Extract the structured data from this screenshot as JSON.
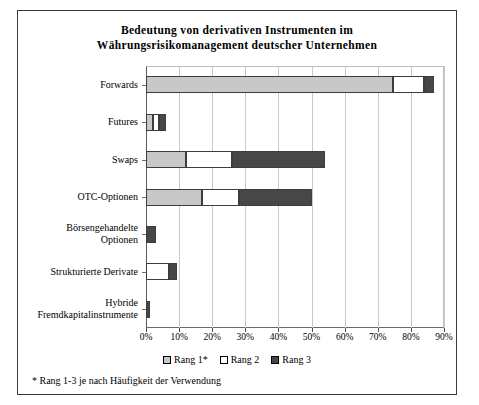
{
  "chart_data": {
    "type": "bar",
    "orientation": "horizontal",
    "stacked": true,
    "title": "Bedeutung von derivativen Instrumenten im Währungsrisikomanagement deutscher Unternehmen",
    "title_lines": [
      "Bedeutung von derivativen Instrumenten im",
      "Währungsrisikomanagement deutscher Unternehmen"
    ],
    "xlabel": "",
    "ylabel": "",
    "xlim": [
      0,
      90
    ],
    "xticks": [
      0,
      10,
      20,
      30,
      40,
      50,
      60,
      70,
      80,
      90
    ],
    "xticklabels": [
      "0%",
      "10%",
      "20%",
      "30%",
      "40%",
      "50%",
      "60%",
      "70%",
      "80%",
      "90%"
    ],
    "grid": true,
    "legend_position": "bottom",
    "categories": [
      "Forwards",
      "Futures",
      "Swaps",
      "OTC-Optionen",
      "Börsengehandelte Optionen",
      "Strukturierte Derivate",
      "Hybride Fremdkapitalinstrumente"
    ],
    "category_lines": [
      [
        "Forwards"
      ],
      [
        "Futures"
      ],
      [
        "Swaps"
      ],
      [
        "OTC-Optionen"
      ],
      [
        "Börsengehandelte",
        "Optionen"
      ],
      [
        "Strukturierte Derivate"
      ],
      [
        "Hybride",
        "Fremdkapitalinstrumente"
      ]
    ],
    "series": [
      {
        "name": "Rang 1*",
        "color": "#c8c8c8",
        "values": [
          74.5,
          2.0,
          12.0,
          17.0,
          0.0,
          0.0,
          0.0
        ]
      },
      {
        "name": "Rang 2",
        "color": "#ffffff",
        "values": [
          9.5,
          1.8,
          14.0,
          11.0,
          0.0,
          7.0,
          0.0
        ]
      },
      {
        "name": "Rang 3",
        "color": "#474747",
        "values": [
          3.0,
          2.2,
          28.0,
          22.0,
          3.0,
          2.5,
          1.2
        ]
      }
    ],
    "totals": [
      87.0,
      6.0,
      54.0,
      50.0,
      3.0,
      9.5,
      1.2
    ],
    "footnote": "* Rang 1-3 je nach Häufigkeit der Verwendung"
  },
  "legend": {
    "items": [
      {
        "label": "Rang 1*",
        "swatch": "k1"
      },
      {
        "label": "Rang 2",
        "swatch": "k2"
      },
      {
        "label": "Rang 3",
        "swatch": "k3"
      }
    ]
  },
  "colors": {
    "rang1": "#c8c8c8",
    "rang2": "#ffffff",
    "rang3": "#474747",
    "border": "#3d3d3d",
    "grid": "#c9c9c9"
  }
}
